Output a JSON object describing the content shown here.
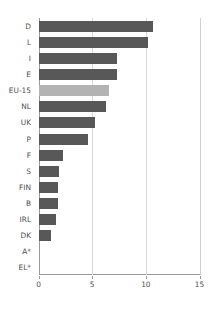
{
  "chart_data": {
    "type": "bar",
    "orientation": "horizontal",
    "title": "",
    "subtitle": "",
    "xlabel": "",
    "ylabel": "",
    "xlim": [
      0,
      15
    ],
    "xticks": [
      0,
      5,
      10,
      15
    ],
    "xticklabels": [
      "0",
      "5",
      "10",
      "15"
    ],
    "grid": "vertical",
    "legend": "none",
    "categories": [
      "D",
      "L",
      "I",
      "E",
      "EU-15",
      "NL",
      "UK",
      "P",
      "F",
      "S",
      "FIN",
      "B",
      "IRL",
      "DK",
      "A*",
      "EL*"
    ],
    "values": [
      10.7,
      10.2,
      7.3,
      7.3,
      6.6,
      6.3,
      5.3,
      4.6,
      2.3,
      1.9,
      1.8,
      1.8,
      1.6,
      1.2,
      0,
      0
    ],
    "series": [
      {
        "name": "value",
        "values": [
          10.7,
          10.2,
          7.3,
          7.3,
          6.6,
          6.3,
          5.3,
          4.6,
          2.3,
          1.9,
          1.8,
          1.8,
          1.6,
          1.2,
          0,
          0
        ]
      }
    ],
    "highlight_category": "EU-15",
    "colors": {
      "bar": "#585858",
      "bar_highlight": "#b3b3b3",
      "grid": "#d9d9d9",
      "axis": "#9a9a9a",
      "text": "#4f4f4f",
      "background": "#ffffff"
    },
    "annotations": [
      "A* has no bar (zero / not available)",
      "EL* has no bar (zero / not available)"
    ]
  }
}
